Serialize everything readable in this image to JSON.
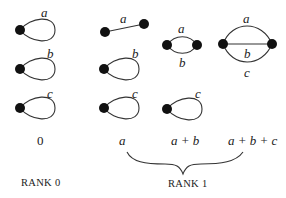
{
  "diagram": {
    "colors": {
      "ink": "#222222",
      "node": "#111111",
      "background": "#ffffff"
    },
    "rank0": {
      "graphs": [
        {
          "type": "loop",
          "edge_label": "a"
        },
        {
          "type": "loop",
          "edge_label": "b"
        },
        {
          "type": "loop",
          "edge_label": "c"
        }
      ],
      "value_label": "0",
      "rank_label": "RANK 0"
    },
    "rank1": {
      "columns": [
        {
          "value_label": "a",
          "graphs": [
            {
              "type": "edge",
              "edge_label": "a"
            },
            {
              "type": "loop",
              "edge_label": "b"
            },
            {
              "type": "loop",
              "edge_label": "c"
            }
          ]
        },
        {
          "value_label": "a + b",
          "graphs": [
            {
              "type": "double-edge",
              "edge_labels": [
                "a",
                "b"
              ]
            },
            {
              "type": "loop",
              "edge_label": "c"
            }
          ]
        },
        {
          "value_label": "a + b + c",
          "graphs": [
            {
              "type": "triple-edge",
              "edge_labels": [
                "a",
                "b",
                "c"
              ]
            }
          ]
        }
      ],
      "rank_label": "RANK 1"
    }
  }
}
